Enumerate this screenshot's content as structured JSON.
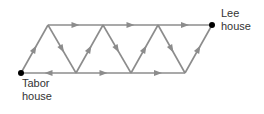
{
  "diagram": {
    "nodes": [
      {
        "id": "tabor",
        "x": 21,
        "y": 73,
        "dot": true
      },
      {
        "id": "t1",
        "x": 48,
        "y": 25
      },
      {
        "id": "t2",
        "x": 103,
        "y": 25
      },
      {
        "id": "t3",
        "x": 158,
        "y": 25
      },
      {
        "id": "lee",
        "x": 212,
        "y": 25,
        "dot": true
      },
      {
        "id": "b1",
        "x": 76,
        "y": 73
      },
      {
        "id": "b2",
        "x": 131,
        "y": 73
      },
      {
        "id": "b3",
        "x": 185,
        "y": 73
      }
    ],
    "edges": [
      {
        "from": "tabor",
        "to": "t1"
      },
      {
        "from": "t1",
        "to": "t2"
      },
      {
        "from": "t2",
        "to": "t3"
      },
      {
        "from": "t3",
        "to": "lee"
      },
      {
        "from": "t1",
        "to": "b1"
      },
      {
        "from": "b1",
        "to": "tabor"
      },
      {
        "from": "b1",
        "to": "t2"
      },
      {
        "from": "t2",
        "to": "b2"
      },
      {
        "from": "b1",
        "to": "b2"
      },
      {
        "from": "b2",
        "to": "t3"
      },
      {
        "from": "t3",
        "to": "b3"
      },
      {
        "from": "b2",
        "to": "b3"
      },
      {
        "from": "b3",
        "to": "lee"
      }
    ],
    "colors": {
      "edge": "#8c8c8c",
      "arrow": "#8c8c8c",
      "dot": "#000000",
      "text": "#333333"
    }
  },
  "labels": {
    "lee": [
      "Lee",
      "house"
    ],
    "tabor": [
      "Tabor",
      "house"
    ]
  }
}
